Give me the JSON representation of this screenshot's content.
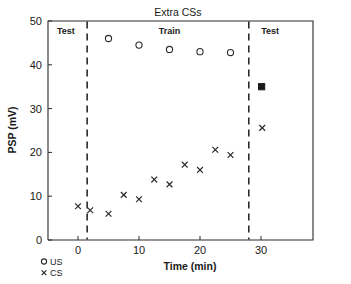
{
  "chart_data": {
    "type": "scatter",
    "title": "Extra CSs",
    "xlabel": "Time (min)",
    "ylabel": "PSP (mV)",
    "xlim": [
      -5,
      35
    ],
    "ylim": [
      0,
      50
    ],
    "xticks": [
      "0",
      "10",
      "20",
      "30"
    ],
    "xtick_values": [
      0,
      10,
      20,
      30
    ],
    "yticks": [
      "0",
      "10",
      "20",
      "30",
      "40",
      "50"
    ],
    "ytick_values": [
      0,
      10,
      20,
      30,
      40,
      50
    ],
    "grid": false,
    "legend_position": "below-left",
    "series": [
      {
        "name": "US",
        "marker": "open-circle",
        "x": [
          5,
          10,
          15,
          20,
          25
        ],
        "y": [
          46.0,
          44.5,
          43.5,
          43.0,
          42.8
        ]
      },
      {
        "name": "CS",
        "marker": "cross",
        "x": [
          0,
          2,
          5,
          7.5,
          10,
          12.5,
          15,
          17.5,
          20,
          22.5,
          25,
          30.2
        ],
        "y": [
          7.7,
          6.8,
          6.0,
          10.3,
          9.3,
          13.8,
          12.7,
          17.2,
          16.0,
          20.6,
          19.4,
          25.6
        ]
      },
      {
        "name": "post-test-US",
        "marker": "filled-square",
        "x": [
          30.1
        ],
        "y": [
          35.0
        ]
      }
    ],
    "annotations": [
      {
        "text": "Test",
        "x": -2.0,
        "y": 47.0
      },
      {
        "text": "Train",
        "x": 15.0,
        "y": 47.0
      },
      {
        "text": "Test",
        "x": 31.5,
        "y": 47.0
      }
    ],
    "dividers": [
      {
        "x": 1.5,
        "style": "dashed"
      },
      {
        "x": 28.0,
        "style": "dashed"
      }
    ]
  },
  "legend": {
    "entries": [
      {
        "label": "US",
        "marker": "open-circle"
      },
      {
        "label": "CS",
        "marker": "cross"
      }
    ]
  },
  "colors": {
    "foreground": "#1a1a1a",
    "axis": "#2b2b2b",
    "background": "#ffffff"
  }
}
